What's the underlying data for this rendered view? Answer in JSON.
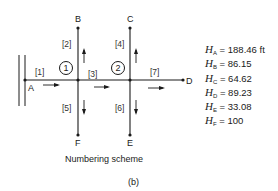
{
  "figure": {
    "caption": "Numbering scheme",
    "panel_label": "(b)"
  },
  "nodes": {
    "A": "A",
    "B": "B",
    "C": "C",
    "D": "D",
    "E": "E",
    "F": "F"
  },
  "junctions": [
    "1",
    "2"
  ],
  "pipes": [
    "[1]",
    "[2]",
    "[3]",
    "[4]",
    "[5]",
    "[6]",
    "[7]"
  ],
  "heads": [
    {
      "var": "H",
      "sub": "A",
      "eq": " = 188.46 ft"
    },
    {
      "var": "H",
      "sub": "B",
      "eq": " = 86.15"
    },
    {
      "var": "H",
      "sub": "C",
      "eq": " = 64.62"
    },
    {
      "var": "H",
      "sub": "D",
      "eq": " = 89.23"
    },
    {
      "var": "H",
      "sub": "E",
      "eq": " = 33.08"
    },
    {
      "var": "H",
      "sub": "F",
      "eq": " = 100"
    }
  ],
  "colors": {
    "line": "#1a1a1a",
    "background": "#ffffff"
  }
}
